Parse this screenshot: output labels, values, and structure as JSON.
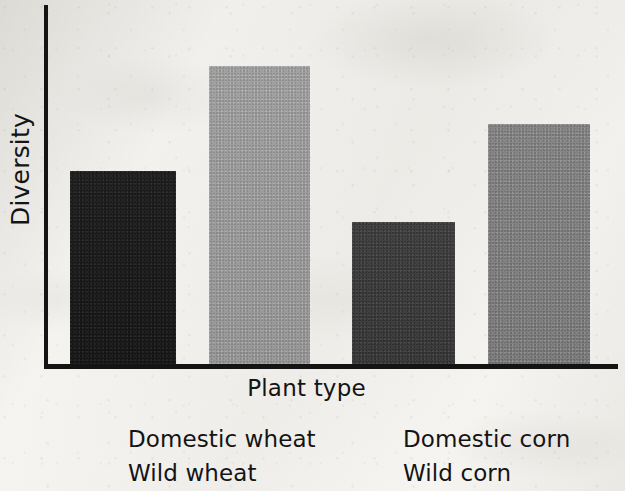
{
  "chart_data": {
    "type": "bar",
    "title": "",
    "xlabel": "Plant type",
    "ylabel": "Diversity",
    "categories": [
      "Domestic wheat",
      "Wild wheat",
      "Domestic corn",
      "Wild corn"
    ],
    "values": [
      54,
      83,
      40,
      67
    ],
    "ylim": [
      0,
      100
    ],
    "yticks": [],
    "xticks": [],
    "grid": false,
    "legend_position": "bottom",
    "series": [
      {
        "name": "Diversity",
        "values": [
          54,
          83,
          40,
          67
        ]
      }
    ],
    "bars": [
      {
        "label": "Domestic wheat",
        "value": 54,
        "color": "#1f1f1f",
        "tone": "tone-darkest"
      },
      {
        "label": "Wild wheat",
        "value": 83,
        "color": "#9d9d9d",
        "tone": "tone-light"
      },
      {
        "label": "Domestic corn",
        "value": 40,
        "color": "#3f3f3f",
        "tone": "tone-dark"
      },
      {
        "label": "Wild corn",
        "value": 67,
        "color": "#838383",
        "tone": "tone-mid"
      }
    ]
  },
  "axes": {
    "y_title": "Diversity",
    "x_title": "Plant type",
    "axis_color": "#141414"
  },
  "legend": {
    "items": [
      {
        "label": "Domestic wheat",
        "color": "#1f1f1f",
        "tone": "tone-darkest"
      },
      {
        "label": "Domestic corn",
        "color": "#3f3f3f",
        "tone": "tone-dark"
      },
      {
        "label": "Wild wheat",
        "color": "#9d9d9d",
        "tone": "tone-light"
      },
      {
        "label": "Wild corn",
        "color": "#838383",
        "tone": "tone-mid"
      }
    ]
  }
}
